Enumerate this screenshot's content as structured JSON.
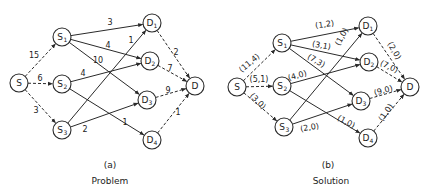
{
  "panels": [
    {
      "id": "a",
      "tag": "(a)",
      "caption": "Problem",
      "tag_pos": [
        110,
        168
      ],
      "caption_pos": [
        110,
        184
      ],
      "nodes": [
        {
          "id": "S",
          "base": "S",
          "sub": "",
          "x": 19,
          "y": 83
        },
        {
          "id": "S1",
          "base": "S",
          "sub": "1",
          "x": 62,
          "y": 37
        },
        {
          "id": "S2",
          "base": "S",
          "sub": "2",
          "x": 62,
          "y": 84
        },
        {
          "id": "S3",
          "base": "S",
          "sub": "3",
          "x": 62,
          "y": 130
        },
        {
          "id": "D1",
          "base": "D",
          "sub": "1",
          "x": 152,
          "y": 23
        },
        {
          "id": "D2",
          "base": "D",
          "sub": "2",
          "x": 150,
          "y": 61
        },
        {
          "id": "D3",
          "base": "D",
          "sub": "3",
          "x": 147,
          "y": 100
        },
        {
          "id": "D4",
          "base": "D",
          "sub": "4",
          "x": 152,
          "y": 140
        },
        {
          "id": "D",
          "base": "D",
          "sub": "",
          "x": 195,
          "y": 86
        }
      ],
      "edges": [
        {
          "from": "S",
          "to": "S1",
          "style": "dash",
          "label": "15",
          "lx": 34,
          "ly": 58
        },
        {
          "from": "S",
          "to": "S2",
          "style": "dash",
          "label": "6",
          "lx": 40,
          "ly": 81
        },
        {
          "from": "S",
          "to": "S3",
          "style": "dash",
          "label": "3",
          "lx": 36,
          "ly": 113
        },
        {
          "from": "S1",
          "to": "D1",
          "style": "solid",
          "label": "3",
          "lx": 110,
          "ly": 25
        },
        {
          "from": "S1",
          "to": "D2",
          "style": "solid",
          "label": "4",
          "lx": 108,
          "ly": 48
        },
        {
          "from": "S1",
          "to": "D3",
          "style": "solid",
          "label": "10",
          "lx": 98,
          "ly": 63
        },
        {
          "from": "S2",
          "to": "D2",
          "style": "solid",
          "label": "4",
          "lx": 83,
          "ly": 76
        },
        {
          "from": "S2",
          "to": "D4",
          "style": "solid",
          "label": "1",
          "lx": 125,
          "ly": 125
        },
        {
          "from": "S3",
          "to": "D1",
          "style": "solid",
          "label": "1",
          "lx": 131,
          "ly": 43
        },
        {
          "from": "S3",
          "to": "D3",
          "style": "solid",
          "label": "2",
          "lx": 85,
          "ly": 132
        },
        {
          "from": "D1",
          "to": "D",
          "style": "dash",
          "label": "2",
          "lx": 176,
          "ly": 55
        },
        {
          "from": "D2",
          "to": "D",
          "style": "dash",
          "label": "7",
          "lx": 170,
          "ly": 71
        },
        {
          "from": "D3",
          "to": "D",
          "style": "dash",
          "label": "9",
          "lx": 168,
          "ly": 93
        },
        {
          "from": "D4",
          "to": "D",
          "style": "dash",
          "label": "1",
          "lx": 178,
          "ly": 115
        }
      ]
    },
    {
      "id": "b",
      "tag": "(b)",
      "caption": "Solution",
      "tag_pos": [
        328,
        168
      ],
      "caption_pos": [
        331,
        184
      ],
      "nodes": [
        {
          "id": "S",
          "base": "S",
          "sub": "",
          "x": 237,
          "y": 87
        },
        {
          "id": "S1",
          "base": "S",
          "sub": "1",
          "x": 282,
          "y": 43
        },
        {
          "id": "S2",
          "base": "S",
          "sub": "2",
          "x": 282,
          "y": 86
        },
        {
          "id": "S3",
          "base": "S",
          "sub": "3",
          "x": 284,
          "y": 127
        },
        {
          "id": "D1",
          "base": "D",
          "sub": "1",
          "x": 368,
          "y": 26
        },
        {
          "id": "D2",
          "base": "D",
          "sub": "2",
          "x": 369,
          "y": 62
        },
        {
          "id": "D3",
          "base": "D",
          "sub": "3",
          "x": 361,
          "y": 101
        },
        {
          "id": "D4",
          "base": "D",
          "sub": "4",
          "x": 368,
          "y": 138
        },
        {
          "id": "D",
          "base": "D",
          "sub": "",
          "x": 410,
          "y": 87
        }
      ],
      "edges": [
        {
          "from": "S",
          "to": "S1",
          "style": "dash",
          "label": "(11,4)",
          "lx": 251,
          "ly": 65,
          "rot": -40
        },
        {
          "from": "S",
          "to": "S2",
          "style": "dash",
          "label": "(5,1)",
          "lx": 259,
          "ly": 82,
          "rot": 0
        },
        {
          "from": "S",
          "to": "S3",
          "style": "dash",
          "label": "(3,0)",
          "lx": 256,
          "ly": 103,
          "rot": 45
        },
        {
          "from": "S1",
          "to": "D1",
          "style": "solid",
          "label": "(1,2)",
          "lx": 325,
          "ly": 27,
          "rot": -8
        },
        {
          "from": "S1",
          "to": "D2",
          "style": "solid",
          "label": "(3,1)",
          "lx": 321,
          "ly": 48,
          "rot": 10
        },
        {
          "from": "S1",
          "to": "D3",
          "style": "solid",
          "label": "(7,3)",
          "lx": 315,
          "ly": 63,
          "rot": 30
        },
        {
          "from": "S2",
          "to": "D2",
          "style": "solid",
          "label": "(4,0)",
          "lx": 298,
          "ly": 78,
          "rot": -15
        },
        {
          "from": "S2",
          "to": "D4",
          "style": "solid",
          "label": "(1,0)",
          "lx": 345,
          "ly": 124,
          "rot": 28
        },
        {
          "from": "S3",
          "to": "D1",
          "style": "solid",
          "label": "(1,0)",
          "lx": 344,
          "ly": 38,
          "rot": -62
        },
        {
          "from": "S3",
          "to": "D3",
          "style": "solid",
          "label": "(2,0)",
          "lx": 310,
          "ly": 130,
          "rot": -10
        },
        {
          "from": "D1",
          "to": "D",
          "style": "dash",
          "label": "(2,0)",
          "lx": 392,
          "ly": 52,
          "rot": 60
        },
        {
          "from": "D2",
          "to": "D",
          "style": "dash",
          "label": "(7,0)",
          "lx": 388,
          "ly": 69,
          "rot": 25
        },
        {
          "from": "D3",
          "to": "D",
          "style": "dash",
          "label": "(9,0)",
          "lx": 384,
          "ly": 93,
          "rot": -15
        },
        {
          "from": "D4",
          "to": "D",
          "style": "dash",
          "label": "(1,0)",
          "lx": 388,
          "ly": 114,
          "rot": -55
        }
      ]
    }
  ]
}
